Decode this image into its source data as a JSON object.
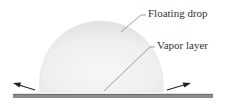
{
  "diagram": {
    "labels": {
      "floating_drop": "Floating drop",
      "vapor_layer": "Vapor layer"
    },
    "colors": {
      "drop_fill": "#ededed",
      "drop_edge": "#e2e2e2",
      "surface": "#8a8a8a",
      "surface_top": "#6a6a6a",
      "leader_line": "#777777",
      "arrow": "#222222",
      "text": "#333333"
    }
  }
}
